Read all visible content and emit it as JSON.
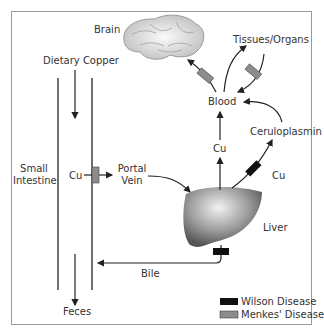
{
  "labels": {
    "brain": "Brain",
    "tissues": "Tissues/Organs",
    "dietary": "Dietary Copper",
    "blood": "Blood",
    "ceruloplasmin": "Ceruloplasmin",
    "cu_blood": "Cu",
    "cu_liver": "Cu",
    "cu_intestine": "Cu",
    "small_intestine_1": "Small",
    "small_intestine_2": "Intestine",
    "portal_1": "Portal",
    "portal_2": "Vein",
    "liver": "Liver",
    "bile": "Bile",
    "feces": "Feces"
  },
  "legend": [
    {
      "label": "Wilson Disease",
      "color": "#111111"
    },
    {
      "label": "Menkes' Disease",
      "color": "#8c8c8c"
    }
  ],
  "colors": {
    "line": "#222222",
    "menkes": "#8c8c8c",
    "wilson": "#111111",
    "frame": "#9a9a9a"
  }
}
